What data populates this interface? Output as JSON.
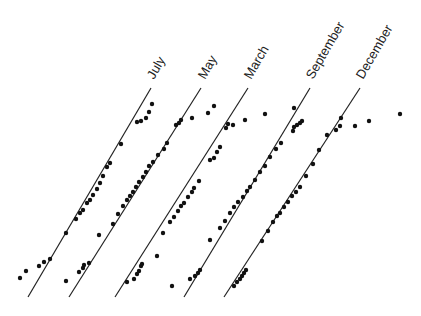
{
  "chart_data": {
    "type": "scatter",
    "title": "",
    "subtitle": "",
    "xlabel": "",
    "ylabel": "",
    "grid": false,
    "legend": "none",
    "series": [
      {
        "name": "July",
        "line": {
          "x1": 28,
          "y1": 297,
          "x2": 151,
          "y2": 88
        },
        "label_pos": {
          "x": 154,
          "y": 80
        },
        "points": [
          [
            20,
            278
          ],
          [
            26,
            271
          ],
          [
            39,
            266
          ],
          [
            44,
            262
          ],
          [
            50,
            259
          ],
          [
            66,
            233
          ],
          [
            76,
            219
          ],
          [
            80,
            213
          ],
          [
            83,
            210
          ],
          [
            87,
            203
          ],
          [
            90,
            200
          ],
          [
            93,
            195
          ],
          [
            97,
            189
          ],
          [
            100,
            183
          ],
          [
            103,
            176
          ],
          [
            107,
            167
          ],
          [
            110,
            163
          ],
          [
            121,
            144
          ],
          [
            137,
            122
          ],
          [
            141,
            121
          ],
          [
            146,
            118
          ],
          [
            149,
            112
          ],
          [
            152,
            104
          ]
        ]
      },
      {
        "name": "May",
        "line": {
          "x1": 69,
          "y1": 297,
          "x2": 201,
          "y2": 88
        },
        "label_pos": {
          "x": 205,
          "y": 80
        },
        "points": [
          [
            66,
            281
          ],
          [
            79,
            272
          ],
          [
            83,
            268
          ],
          [
            84,
            265
          ],
          [
            89,
            263
          ],
          [
            99,
            235
          ],
          [
            113,
            224
          ],
          [
            118,
            214
          ],
          [
            123,
            206
          ],
          [
            127,
            200
          ],
          [
            130,
            196
          ],
          [
            133,
            192
          ],
          [
            136,
            187
          ],
          [
            139,
            182
          ],
          [
            143,
            177
          ],
          [
            146,
            172
          ],
          [
            149,
            166
          ],
          [
            153,
            162
          ],
          [
            158,
            155
          ],
          [
            164,
            149
          ],
          [
            167,
            143
          ],
          [
            176,
            125
          ],
          [
            179,
            123
          ],
          [
            181,
            120
          ],
          [
            192,
            118
          ],
          [
            208,
            113
          ],
          [
            214,
            106
          ]
        ]
      },
      {
        "name": "March",
        "line": {
          "x1": 115,
          "y1": 297,
          "x2": 248,
          "y2": 88
        },
        "label_pos": {
          "x": 251,
          "y": 80
        },
        "points": [
          [
            127,
            282
          ],
          [
            134,
            279
          ],
          [
            137,
            274
          ],
          [
            139,
            271
          ],
          [
            141,
            266
          ],
          [
            142,
            264
          ],
          [
            157,
            256
          ],
          [
            163,
            233
          ],
          [
            170,
            222
          ],
          [
            174,
            217
          ],
          [
            178,
            211
          ],
          [
            181,
            206
          ],
          [
            184,
            203
          ],
          [
            188,
            197
          ],
          [
            192,
            192
          ],
          [
            194,
            188
          ],
          [
            199,
            181
          ],
          [
            210,
            160
          ],
          [
            214,
            158
          ],
          [
            217,
            152
          ],
          [
            220,
            147
          ],
          [
            226,
            128
          ],
          [
            228,
            124
          ],
          [
            233,
            125
          ],
          [
            245,
            120
          ],
          [
            265,
            114
          ]
        ]
      },
      {
        "name": "September",
        "line": {
          "x1": 184,
          "y1": 297,
          "x2": 310,
          "y2": 88
        },
        "label_pos": {
          "x": 313,
          "y": 80
        },
        "points": [
          [
            172,
            286
          ],
          [
            190,
            279
          ],
          [
            195,
            276
          ],
          [
            198,
            273
          ],
          [
            200,
            270
          ],
          [
            210,
            240
          ],
          [
            220,
            228
          ],
          [
            225,
            221
          ],
          [
            230,
            213
          ],
          [
            234,
            207
          ],
          [
            238,
            202
          ],
          [
            243,
            197
          ],
          [
            247,
            191
          ],
          [
            250,
            187
          ],
          [
            255,
            180
          ],
          [
            260,
            172
          ],
          [
            265,
            166
          ],
          [
            270,
            157
          ],
          [
            276,
            149
          ],
          [
            281,
            143
          ],
          [
            293,
            131
          ],
          [
            294,
            127
          ],
          [
            297,
            125
          ],
          [
            300,
            123
          ],
          [
            302,
            121
          ],
          [
            294,
            108
          ]
        ]
      },
      {
        "name": "December",
        "line": {
          "x1": 224,
          "y1": 297,
          "x2": 360,
          "y2": 88
        },
        "label_pos": {
          "x": 363,
          "y": 80
        },
        "points": [
          [
            234,
            286
          ],
          [
            237,
            282
          ],
          [
            240,
            279
          ],
          [
            242,
            276
          ],
          [
            244,
            273
          ],
          [
            246,
            270
          ],
          [
            262,
            241
          ],
          [
            268,
            231
          ],
          [
            273,
            222
          ],
          [
            277,
            216
          ],
          [
            280,
            213
          ],
          [
            284,
            207
          ],
          [
            288,
            202
          ],
          [
            292,
            196
          ],
          [
            296,
            192
          ],
          [
            300,
            187
          ],
          [
            306,
            176
          ],
          [
            313,
            164
          ],
          [
            319,
            150
          ],
          [
            327,
            135
          ],
          [
            336,
            130
          ],
          [
            340,
            126
          ],
          [
            355,
            126
          ],
          [
            341,
            118
          ],
          [
            369,
            121
          ],
          [
            400,
            114
          ]
        ]
      }
    ]
  }
}
